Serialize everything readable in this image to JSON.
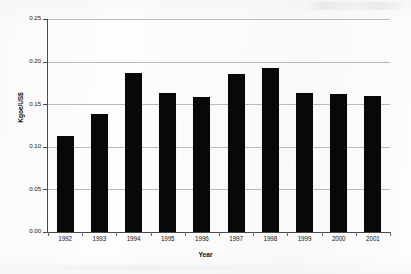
{
  "chart_data": {
    "type": "bar",
    "title": "",
    "xlabel": "Year",
    "ylabel": "Kgoe/US$",
    "categories": [
      "1992",
      "1993",
      "1994",
      "1995",
      "1996",
      "1997",
      "1998",
      "1999",
      "2000",
      "2001"
    ],
    "values": [
      0.113,
      0.138,
      0.187,
      0.163,
      0.159,
      0.186,
      0.192,
      0.163,
      0.162,
      0.16
    ],
    "ylim": [
      0.0,
      0.25
    ],
    "ytick_labels": [
      "0.00",
      "0.05",
      "0.10",
      "0.15",
      "0.20",
      "0.25"
    ],
    "ytick_values": [
      0.0,
      0.05,
      0.1,
      0.15,
      0.2,
      0.25
    ],
    "grid": true,
    "legend": false,
    "legend_position": "none",
    "series": [
      {
        "name": "Energy intensity",
        "color": "#080808",
        "values": [
          0.113,
          0.138,
          0.187,
          0.163,
          0.159,
          0.186,
          0.192,
          0.163,
          0.162,
          0.16
        ]
      }
    ]
  },
  "colors": {
    "bar": "#080808",
    "gridline": "#b9b9b9",
    "axis": "#4a4a4a",
    "text": "#141414",
    "background": "#fdfdfd"
  }
}
